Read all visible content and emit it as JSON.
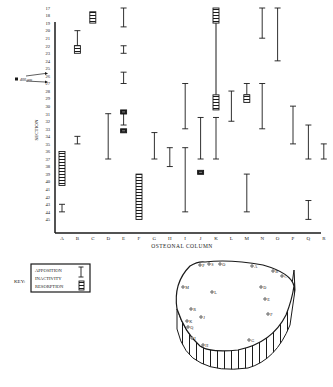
{
  "chart_data": {
    "type": "range-bar",
    "title": "",
    "xlabel": "OSTEONAL COLUMN",
    "ylabel": "SECTION",
    "categories": [
      "A",
      "B",
      "C",
      "D",
      "E",
      "F",
      "G",
      "H",
      "I",
      "J",
      "K",
      "L",
      "M",
      "N",
      "O",
      "P",
      "Q",
      "R"
    ],
    "y_ticks": [
      "17",
      "18",
      "19",
      "20",
      "21",
      "22",
      "23",
      "24",
      "25",
      "26",
      "27",
      "28",
      "29",
      "30",
      "31",
      "32",
      "33",
      "34",
      "35",
      "36",
      "37",
      "38",
      "39",
      "40",
      "41",
      "42",
      "43",
      "44",
      "45"
    ],
    "ylim": [
      17,
      45
    ],
    "y_inverted": true,
    "annotation": {
      "label": "400 µm",
      "from_section": 24,
      "to_section": 25
    },
    "legend": {
      "title": "KEY:",
      "entries": [
        {
          "label": "APPOSITION",
          "symbol": "I-bar"
        },
        {
          "label": "INACTIVITY",
          "symbol": "line"
        },
        {
          "label": "RESORPTION",
          "symbol": "hatched-box"
        }
      ]
    },
    "series": [
      {
        "column": "A",
        "resorption": [
          [
            36,
            40.5
          ]
        ],
        "apposition": [
          [
            43,
            44
          ]
        ]
      },
      {
        "column": "B",
        "resorption": [
          [
            22,
            23
          ]
        ],
        "apposition": [
          [
            20,
            22
          ],
          [
            34,
            35
          ]
        ]
      },
      {
        "column": "C",
        "resorption": [
          [
            17.5,
            19
          ]
        ],
        "apposition": []
      },
      {
        "column": "D",
        "resorption": [],
        "apposition": [
          [
            31,
            37
          ]
        ]
      },
      {
        "column": "E",
        "resorption": [
          [
            30.5,
            31
          ],
          [
            33,
            33.5
          ]
        ],
        "apposition": [
          [
            17,
            19.5
          ],
          [
            22,
            23
          ],
          [
            25.5,
            27
          ],
          [
            31,
            32.5
          ]
        ]
      },
      {
        "column": "F",
        "resorption": [
          [
            39,
            45
          ]
        ],
        "apposition": []
      },
      {
        "column": "G",
        "resorption": [],
        "apposition": [
          [
            33.5,
            37
          ]
        ]
      },
      {
        "column": "H",
        "resorption": [],
        "apposition": [
          [
            35.5,
            38
          ]
        ]
      },
      {
        "column": "I",
        "resorption": [],
        "apposition": [
          [
            27,
            33
          ],
          [
            35.5,
            44
          ]
        ]
      },
      {
        "column": "J",
        "resorption": [
          [
            38.5,
            39
          ]
        ],
        "apposition": [
          [
            31.5,
            37
          ]
        ]
      },
      {
        "column": "K",
        "resorption": [
          [
            17,
            19
          ],
          [
            28.5,
            30.5
          ]
        ],
        "inactivity": [
          [
            19,
            28.5
          ]
        ],
        "apposition": [
          [
            31.5,
            37
          ]
        ]
      },
      {
        "column": "L",
        "resorption": [],
        "apposition": [
          [
            28,
            32
          ]
        ]
      },
      {
        "column": "M",
        "resorption": [
          [
            28.5,
            29.5
          ]
        ],
        "apposition": [
          [
            27,
            28.5
          ],
          [
            39,
            44
          ]
        ]
      },
      {
        "column": "N",
        "resorption": [],
        "apposition": [
          [
            17,
            21
          ],
          [
            27,
            33
          ]
        ]
      },
      {
        "column": "O",
        "resorption": [],
        "apposition": [
          [
            17,
            24
          ]
        ]
      },
      {
        "column": "P",
        "resorption": [],
        "apposition": [
          [
            30,
            35
          ]
        ]
      },
      {
        "column": "Q",
        "resorption": [],
        "apposition": [
          [
            32.5,
            37
          ],
          [
            42.5,
            45
          ]
        ]
      },
      {
        "column": "R",
        "resorption": [],
        "apposition": [
          [
            35,
            37
          ]
        ]
      }
    ],
    "cross_section_map": {
      "points": [
        {
          "label": "P",
          "x": 200,
          "y": 265
        },
        {
          "label": "S",
          "x": 209,
          "y": 264
        },
        {
          "label": "O",
          "x": 220,
          "y": 264
        },
        {
          "label": "A",
          "x": 252,
          "y": 266
        },
        {
          "label": "B",
          "x": 273,
          "y": 271
        },
        {
          "label": "C",
          "x": 282,
          "y": 276
        },
        {
          "label": "M",
          "x": 183,
          "y": 287
        },
        {
          "label": "L",
          "x": 212,
          "y": 292
        },
        {
          "label": "D",
          "x": 261,
          "y": 287
        },
        {
          "label": "E",
          "x": 265,
          "y": 299
        },
        {
          "label": "R",
          "x": 191,
          "y": 309
        },
        {
          "label": "F",
          "x": 268,
          "y": 314
        },
        {
          "label": "J",
          "x": 201,
          "y": 317
        },
        {
          "label": "K",
          "x": 187,
          "y": 321
        },
        {
          "label": "Q",
          "x": 188,
          "y": 327
        },
        {
          "label": "I",
          "x": 192,
          "y": 338
        },
        {
          "label": "H",
          "x": 203,
          "y": 345
        },
        {
          "label": "G",
          "x": 249,
          "y": 340
        }
      ]
    }
  },
  "labels": {
    "ylabel": "SECTION",
    "xlabel": "OSTEONAL COLUMN",
    "annotation": "400 µm",
    "key_title": "KEY:",
    "key_apposition": "APPOSITION",
    "key_inactivity": "INACTIVITY",
    "key_resorption": "RESORPTION"
  },
  "colors": {
    "ink": "#1a1a1a",
    "background": "#ffffff"
  }
}
